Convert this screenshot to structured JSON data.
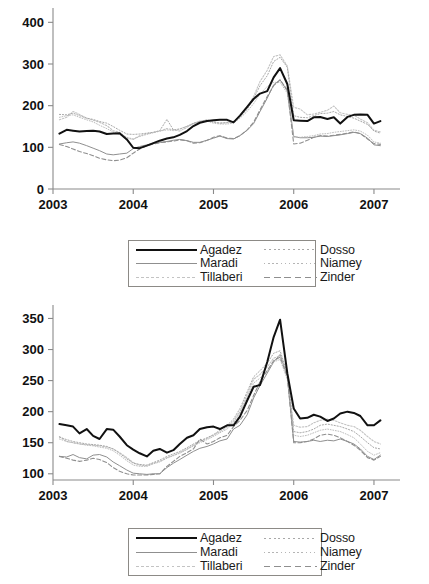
{
  "chart_data": [
    {
      "id": "top",
      "type": "line",
      "title": "",
      "xlabel": "",
      "ylabel": "",
      "xlim": [
        2003.0,
        2007.15
      ],
      "ylim": [
        0,
        420
      ],
      "yticks": [
        0,
        100,
        200,
        300,
        400
      ],
      "xticks": [
        2003,
        2004,
        2005,
        2006,
        2007
      ],
      "xtick_labels": [
        "2003",
        "2004",
        "2005",
        "2006",
        "2007"
      ],
      "ytick_labels": [
        "0",
        "100",
        "200",
        "300",
        "400"
      ],
      "grid": false,
      "legend_position": "below-center",
      "x": [
        2003.08,
        2003.17,
        2003.25,
        2003.33,
        2003.42,
        2003.5,
        2003.58,
        2003.67,
        2003.75,
        2003.83,
        2003.92,
        2004.0,
        2004.08,
        2004.17,
        2004.25,
        2004.33,
        2004.42,
        2004.5,
        2004.58,
        2004.67,
        2004.75,
        2004.83,
        2004.92,
        2005.0,
        2005.08,
        2005.17,
        2005.25,
        2005.33,
        2005.42,
        2005.5,
        2005.58,
        2005.67,
        2005.75,
        2005.83,
        2005.92,
        2006.0,
        2006.08,
        2006.17,
        2006.25,
        2006.33,
        2006.42,
        2006.5,
        2006.58,
        2006.67,
        2006.75,
        2006.83,
        2006.92,
        2007.0,
        2007.08
      ],
      "series": [
        {
          "name": "Agadez",
          "style": "solid-thick-black",
          "color": "#111111",
          "values": [
            133,
            142,
            140,
            138,
            139,
            140,
            138,
            132,
            133,
            134,
            119,
            99,
            98,
            104,
            110,
            116,
            121,
            124,
            130,
            139,
            151,
            159,
            163,
            165,
            166,
            166,
            160,
            176,
            197,
            216,
            229,
            235,
            268,
            290,
            252,
            165,
            164,
            163,
            172,
            173,
            168,
            172,
            157,
            173,
            178,
            179,
            178,
            157,
            163
          ]
        },
        {
          "name": "Maradi",
          "style": "solid-thin-gray",
          "color": "#8f8f8f",
          "values": [
            108,
            111,
            113,
            110,
            104,
            98,
            92,
            84,
            82,
            84,
            86,
            97,
            102,
            106,
            109,
            112,
            114,
            117,
            119,
            116,
            112,
            112,
            117,
            122,
            127,
            121,
            120,
            128,
            141,
            157,
            186,
            218,
            250,
            262,
            235,
            126,
            123,
            123,
            124,
            127,
            126,
            128,
            130,
            133,
            136,
            133,
            122,
            106,
            104
          ]
        },
        {
          "name": "Tillaberi",
          "style": "dotted-light",
          "color": "#c3c3c3",
          "values": [
            166,
            172,
            186,
            179,
            170,
            165,
            160,
            152,
            140,
            136,
            122,
            119,
            128,
            133,
            136,
            139,
            145,
            142,
            139,
            148,
            157,
            163,
            166,
            162,
            158,
            160,
            162,
            175,
            196,
            222,
            258,
            285,
            318,
            322,
            295,
            196,
            192,
            178,
            180,
            184,
            189,
            199,
            183,
            179,
            177,
            168,
            159,
            141,
            137
          ]
        },
        {
          "name": "Dosso",
          "style": "dotted-mid",
          "color": "#a8a8a8",
          "values": [
            179,
            178,
            182,
            176,
            170,
            167,
            162,
            158,
            150,
            141,
            132,
            131,
            132,
            134,
            136,
            140,
            167,
            142,
            144,
            150,
            158,
            162,
            165,
            160,
            158,
            159,
            162,
            174,
            191,
            217,
            248,
            272,
            306,
            316,
            292,
            176,
            172,
            171,
            176,
            181,
            182,
            186,
            178,
            174,
            170,
            163,
            155,
            139,
            134
          ]
        },
        {
          "name": "Niamey",
          "style": "dotted-fine",
          "color": "#b5b5b5",
          "values": [
            172,
            176,
            178,
            172,
            166,
            161,
            153,
            145,
            137,
            131,
            124,
            120,
            126,
            131,
            135,
            139,
            142,
            140,
            144,
            151,
            157,
            161,
            163,
            158,
            156,
            156,
            158,
            170,
            186,
            205,
            228,
            246,
            256,
            256,
            230,
            125,
            124,
            126,
            128,
            132,
            133,
            136,
            138,
            140,
            142,
            139,
            129,
            113,
            110
          ]
        },
        {
          "name": "Zinder",
          "style": "dashed",
          "color": "#8f8f8f",
          "values": [
            107,
            102,
            96,
            90,
            85,
            80,
            74,
            70,
            68,
            69,
            75,
            86,
            96,
            104,
            108,
            111,
            113,
            115,
            118,
            116,
            110,
            111,
            117,
            124,
            128,
            122,
            121,
            128,
            142,
            160,
            190,
            222,
            248,
            262,
            238,
            108,
            110,
            117,
            124,
            128,
            127,
            129,
            131,
            134,
            137,
            133,
            120,
            109,
            107
          ]
        }
      ]
    },
    {
      "id": "bottom",
      "type": "line",
      "title": "",
      "xlabel": "",
      "ylabel": "",
      "xlim": [
        2003.0,
        2007.15
      ],
      "ylim": [
        90,
        362
      ],
      "yticks": [
        100,
        150,
        200,
        250,
        300,
        350
      ],
      "xticks": [
        2003,
        2004,
        2005,
        2006,
        2007
      ],
      "xtick_labels": [
        "2003",
        "2004",
        "2005",
        "2006",
        "2007"
      ],
      "ytick_labels": [
        "100",
        "150",
        "200",
        "250",
        "300",
        "350"
      ],
      "grid": false,
      "legend_position": "below-center",
      "x": [
        2003.08,
        2003.17,
        2003.25,
        2003.33,
        2003.42,
        2003.5,
        2003.58,
        2003.67,
        2003.75,
        2003.83,
        2003.92,
        2004.0,
        2004.08,
        2004.17,
        2004.25,
        2004.33,
        2004.42,
        2004.5,
        2004.58,
        2004.67,
        2004.75,
        2004.83,
        2004.92,
        2005.0,
        2005.08,
        2005.17,
        2005.25,
        2005.33,
        2005.42,
        2005.5,
        2005.58,
        2005.67,
        2005.75,
        2005.83,
        2005.92,
        2006.0,
        2006.08,
        2006.17,
        2006.25,
        2006.33,
        2006.42,
        2006.5,
        2006.58,
        2006.67,
        2006.75,
        2006.83,
        2006.92,
        2007.0,
        2007.08
      ],
      "series": [
        {
          "name": "Agadez",
          "style": "solid-thick-black",
          "color": "#111111",
          "values": [
            180,
            178,
            176,
            165,
            172,
            161,
            156,
            172,
            171,
            160,
            146,
            139,
            133,
            128,
            137,
            140,
            134,
            138,
            148,
            158,
            162,
            172,
            175,
            176,
            172,
            178,
            178,
            192,
            218,
            240,
            243,
            280,
            320,
            348,
            262,
            205,
            189,
            190,
            195,
            192,
            185,
            189,
            197,
            200,
            198,
            193,
            178,
            178,
            186
          ]
        },
        {
          "name": "Maradi",
          "style": "solid-thin-gray",
          "color": "#8f8f8f",
          "values": [
            128,
            127,
            131,
            126,
            124,
            130,
            131,
            127,
            119,
            113,
            106,
            101,
            100,
            99,
            100,
            100,
            110,
            117,
            123,
            130,
            136,
            141,
            144,
            148,
            153,
            156,
            172,
            178,
            195,
            222,
            242,
            262,
            280,
            292,
            258,
            152,
            151,
            152,
            154,
            152,
            154,
            153,
            156,
            152,
            148,
            140,
            128,
            123,
            130
          ]
        },
        {
          "name": "Tillaberi",
          "style": "dotted-light",
          "color": "#c3c3c3",
          "values": [
            160,
            152,
            150,
            148,
            147,
            146,
            145,
            143,
            140,
            134,
            126,
            118,
            114,
            113,
            117,
            120,
            126,
            130,
            134,
            140,
            146,
            152,
            157,
            162,
            168,
            175,
            185,
            200,
            228,
            252,
            260,
            272,
            286,
            290,
            258,
            178,
            175,
            176,
            182,
            186,
            188,
            186,
            182,
            178,
            176,
            170,
            160,
            152,
            148
          ]
        },
        {
          "name": "Dosso",
          "style": "dotted-mid",
          "color": "#a8a8a8",
          "values": [
            159,
            155,
            152,
            150,
            148,
            147,
            146,
            144,
            140,
            133,
            124,
            117,
            115,
            114,
            118,
            122,
            128,
            132,
            136,
            142,
            148,
            153,
            158,
            163,
            170,
            178,
            188,
            205,
            232,
            256,
            266,
            278,
            294,
            298,
            262,
            168,
            166,
            168,
            172,
            178,
            180,
            178,
            176,
            172,
            168,
            160,
            150,
            142,
            140
          ]
        },
        {
          "name": "Niamey",
          "style": "dotted-fine",
          "color": "#b5b5b5",
          "values": [
            156,
            152,
            150,
            148,
            146,
            145,
            143,
            141,
            137,
            130,
            121,
            114,
            112,
            112,
            116,
            119,
            125,
            129,
            133,
            139,
            145,
            150,
            155,
            160,
            166,
            172,
            182,
            198,
            224,
            246,
            254,
            266,
            280,
            284,
            252,
            162,
            160,
            162,
            166,
            170,
            172,
            170,
            168,
            163,
            158,
            148,
            136,
            130,
            134
          ]
        },
        {
          "name": "Zinder",
          "style": "dashed",
          "color": "#8f8f8f",
          "values": [
            128,
            125,
            122,
            120,
            122,
            125,
            123,
            118,
            110,
            104,
            100,
            98,
            98,
            98,
            99,
            100,
            112,
            120,
            128,
            134,
            140,
            156,
            148,
            152,
            158,
            162,
            176,
            186,
            202,
            226,
            248,
            266,
            282,
            288,
            256,
            150,
            150,
            152,
            156,
            162,
            164,
            162,
            158,
            152,
            146,
            138,
            126,
            122,
            128
          ]
        }
      ]
    }
  ],
  "legend": {
    "top": {
      "entries": [
        {
          "label": "Agadez",
          "style": "solid-thick-black"
        },
        {
          "label": "Dosso",
          "style": "dotted-mid"
        },
        {
          "label": "Maradi",
          "style": "solid-thin-gray"
        },
        {
          "label": "Niamey",
          "style": "dotted-fine"
        },
        {
          "label": "Tillaberi",
          "style": "dotted-light"
        },
        {
          "label": "Zinder",
          "style": "dashed"
        }
      ]
    },
    "bottom": {
      "entries": [
        {
          "label": "Agadez",
          "style": "solid-thick-black"
        },
        {
          "label": "Dosso",
          "style": "dotted-mid"
        },
        {
          "label": "Maradi",
          "style": "solid-thin-gray"
        },
        {
          "label": "Niamey",
          "style": "dotted-fine"
        },
        {
          "label": "Tillaberi",
          "style": "dotted-light"
        },
        {
          "label": "Zinder",
          "style": "dashed"
        }
      ]
    }
  },
  "colors": {
    "agadez": "#111111",
    "maradi": "#8f8f8f",
    "tillaberi": "#c3c3c3",
    "dosso": "#a8a8a8",
    "niamey": "#b5b5b5",
    "zinder": "#8f8f8f",
    "axis": "#8a8a8a",
    "text": "#111111",
    "legend_border": "#8c8a86",
    "background": "#ffffff"
  }
}
